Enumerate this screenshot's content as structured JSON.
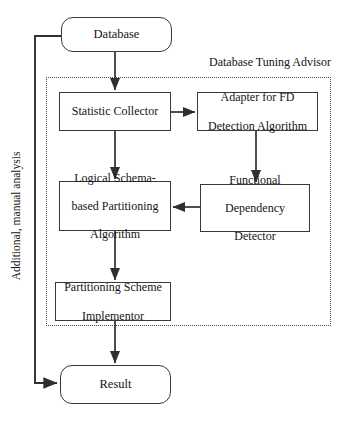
{
  "diagram": {
    "container_label": "Database Tuning Advisor",
    "side_label": "Additional, manual analysis",
    "nodes": {
      "database": "Database",
      "statistic_collector": "Statistic Collector",
      "adapter": "Adapter for FD\nDetection Algorithm",
      "adapter_line1": "Adapter for FD",
      "adapter_line2": "Detection Algorithm",
      "logical_line1": "Logical Schema-",
      "logical_line2": "based Partitioning",
      "logical_line3": "Algorithm",
      "fdd_line1": "Functional",
      "fdd_line2": "Dependency",
      "fdd_line3": "Detector",
      "psi_line1": "Partitioning Scheme",
      "psi_line2": "Implementor",
      "result": "Result"
    },
    "edges": [
      {
        "from": "Database",
        "to": "Statistic Collector",
        "direction": "down"
      },
      {
        "from": "Statistic Collector",
        "to": "Adapter for FD Detection Algorithm",
        "direction": "right"
      },
      {
        "from": "Statistic Collector",
        "to": "Logical Schema-based Partitioning Algorithm",
        "direction": "down"
      },
      {
        "from": "Adapter for FD Detection Algorithm",
        "to": "Functional Dependency Detector",
        "direction": "down"
      },
      {
        "from": "Functional Dependency Detector",
        "to": "Logical Schema-based Partitioning Algorithm",
        "direction": "left"
      },
      {
        "from": "Logical Schema-based Partitioning Algorithm",
        "to": "Partitioning Scheme Implementor",
        "direction": "down"
      },
      {
        "from": "Partitioning Scheme Implementor",
        "to": "Result",
        "direction": "down"
      },
      {
        "from": "Result",
        "to": "Database",
        "direction": "feedback-left",
        "label": "Additional, manual analysis"
      }
    ],
    "colors": {
      "stroke": "#3a3a3a",
      "dotted": "#4a4a4a",
      "text": "#141414",
      "background": "#ffffff"
    }
  }
}
